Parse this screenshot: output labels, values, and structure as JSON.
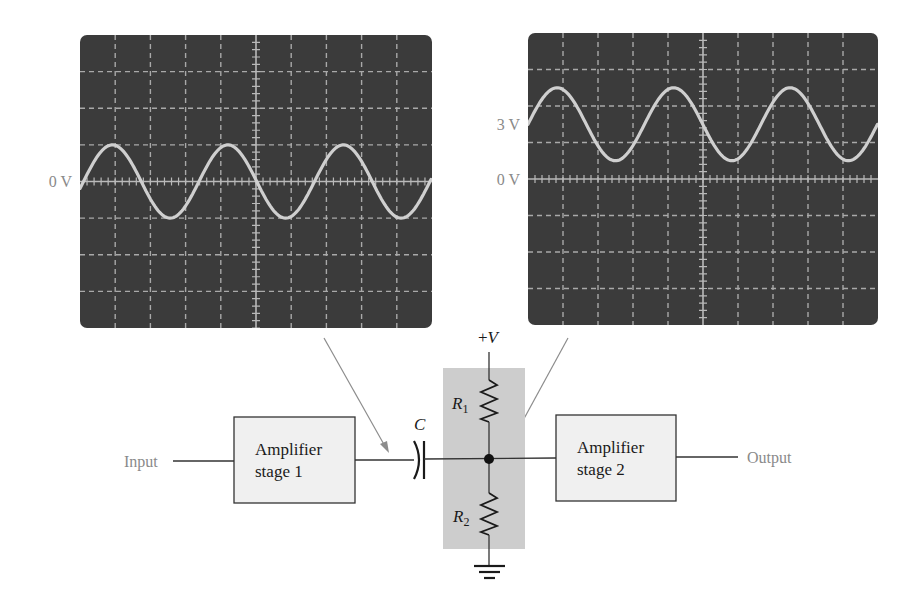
{
  "colors": {
    "scope_screen": "#3b3b3b",
    "trace": "#cfcfcf",
    "grid": "#a9a9a9",
    "label_grey": "#8a8a8a",
    "bias_shade": "#cdcdcd",
    "block_fill": "#f0f0f0"
  },
  "scopes": [
    {
      "id": "scope-before-capacitor",
      "rect": {
        "x": 80,
        "y": 35,
        "w": 352,
        "h": 293,
        "r": 7
      },
      "divisions": {
        "x": 10,
        "y": 8
      },
      "labels": [
        {
          "text": "0 V",
          "div": 0
        }
      ],
      "trace": {
        "offset_div": 0,
        "amplitude_div": 1.0,
        "period_px": 115.5,
        "zero_cross_x": 83.5
      }
    },
    {
      "id": "scope-after-capacitor",
      "rect": {
        "x": 528,
        "y": 33,
        "w": 350,
        "h": 292,
        "r": 7
      },
      "divisions": {
        "x": 10,
        "y": 8
      },
      "labels": [
        {
          "text": "3 V",
          "div": 1.5
        },
        {
          "text": "0 V",
          "div": 0
        }
      ],
      "trace": {
        "offset_div": 1.5,
        "amplitude_div": 1.0,
        "period_px": 116.5,
        "zero_cross_x": 528
      }
    }
  ],
  "chart_data": [
    {
      "type": "line",
      "title": "Signal at output of amplifier stage 1 (before C)",
      "ylabel": "Voltage",
      "annotations": [
        "0 V"
      ],
      "dc_level_v": 0,
      "waveform": "sine",
      "cycles_visible": 3,
      "grid": true
    },
    {
      "type": "line",
      "title": "Signal at input of amplifier stage 2 (after C, biased)",
      "ylabel": "Voltage",
      "annotations": [
        "3 V",
        "0 V"
      ],
      "dc_level_v": 3,
      "waveform": "sine",
      "cycles_visible": 3,
      "grid": true
    }
  ],
  "circuit": {
    "input_label": "Input",
    "output_label": "Output",
    "stage1": {
      "line1": "Amplifier",
      "line2": "stage 1"
    },
    "stage2": {
      "line1": "Amplifier",
      "line2": "stage 2"
    },
    "capacitor_label": "C",
    "supply_label": "+V",
    "r1": {
      "main": "R",
      "sub": "1"
    },
    "r2": {
      "main": "R",
      "sub": "2"
    }
  }
}
